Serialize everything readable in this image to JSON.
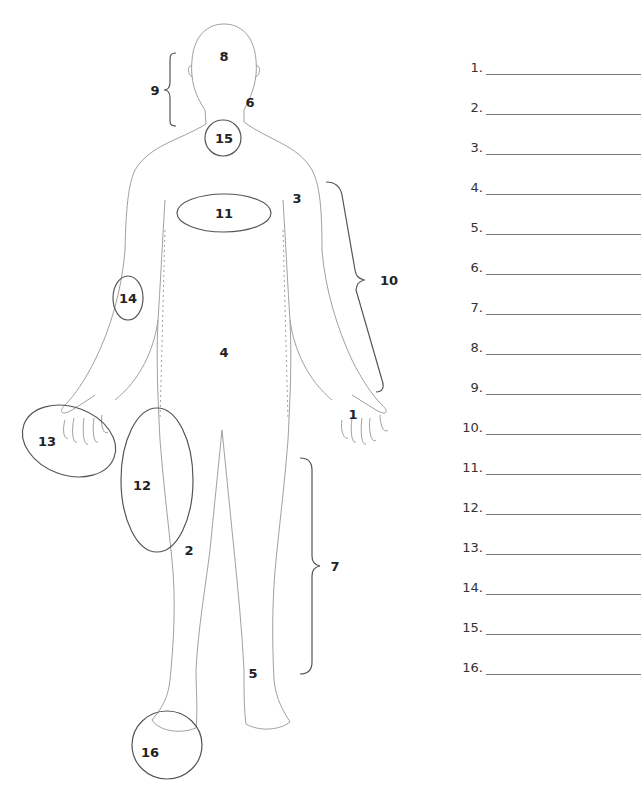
{
  "diagram": {
    "type": "labeled-body-outline",
    "labels": [
      {
        "id": 1,
        "text": "1",
        "x": 353,
        "y": 414
      },
      {
        "id": 2,
        "text": "2",
        "x": 189,
        "y": 550
      },
      {
        "id": 3,
        "text": "3",
        "x": 297,
        "y": 198
      },
      {
        "id": 4,
        "text": "4",
        "x": 224,
        "y": 352
      },
      {
        "id": 5,
        "text": "5",
        "x": 253,
        "y": 673
      },
      {
        "id": 6,
        "text": "6",
        "x": 250,
        "y": 102
      },
      {
        "id": 7,
        "text": "7",
        "x": 335,
        "y": 566
      },
      {
        "id": 8,
        "text": "8",
        "x": 224,
        "y": 56
      },
      {
        "id": 9,
        "text": "9",
        "x": 155,
        "y": 90
      },
      {
        "id": 10,
        "text": "10",
        "x": 389,
        "y": 280
      },
      {
        "id": 11,
        "text": "11",
        "x": 224,
        "y": 213
      },
      {
        "id": 12,
        "text": "12",
        "x": 142,
        "y": 485
      },
      {
        "id": 13,
        "text": "13",
        "x": 47,
        "y": 441
      },
      {
        "id": 14,
        "text": "14",
        "x": 128,
        "y": 298
      },
      {
        "id": 15,
        "text": "15",
        "x": 224,
        "y": 138
      },
      {
        "id": 16,
        "text": "16",
        "x": 150,
        "y": 752
      }
    ],
    "circles": [
      {
        "label": "15",
        "cx": 223,
        "cy": 138,
        "rx": 18,
        "ry": 18
      },
      {
        "label": "11",
        "cx": 224,
        "cy": 213,
        "rx": 47,
        "ry": 19
      },
      {
        "label": "14",
        "cx": 128,
        "cy": 298,
        "rx": 15,
        "ry": 22
      },
      {
        "label": "13",
        "cx": 69,
        "cy": 441,
        "rx": 48,
        "ry": 34
      },
      {
        "label": "12",
        "cx": 157,
        "cy": 480,
        "rx": 36,
        "ry": 72
      },
      {
        "label": "16",
        "cx": 167,
        "cy": 745,
        "rx": 35,
        "ry": 34
      }
    ],
    "braces": [
      {
        "label": "9",
        "side": "left",
        "x": 175,
        "top": 52,
        "bottom": 125
      },
      {
        "label": "10",
        "side": "right",
        "x": 368,
        "top": 180,
        "bottom": 390
      },
      {
        "label": "7",
        "side": "right",
        "x": 315,
        "top": 458,
        "bottom": 673
      }
    ]
  },
  "answer_sheet": {
    "rows": [
      {
        "number": "1.",
        "value": ""
      },
      {
        "number": "2.",
        "value": ""
      },
      {
        "number": "3.",
        "value": ""
      },
      {
        "number": "4.",
        "value": ""
      },
      {
        "number": "5.",
        "value": ""
      },
      {
        "number": "6.",
        "value": ""
      },
      {
        "number": "7.",
        "value": ""
      },
      {
        "number": "8.",
        "value": ""
      },
      {
        "number": "9.",
        "value": ""
      },
      {
        "number": "10.",
        "value": ""
      },
      {
        "number": "11.",
        "value": ""
      },
      {
        "number": "12.",
        "value": ""
      },
      {
        "number": "13.",
        "value": ""
      },
      {
        "number": "14.",
        "value": ""
      },
      {
        "number": "15.",
        "value": ""
      },
      {
        "number": "16.",
        "value": ""
      }
    ]
  },
  "colors": {
    "outline": "#9a9a9a",
    "annotation": "#555555",
    "label_text": "#222222"
  }
}
